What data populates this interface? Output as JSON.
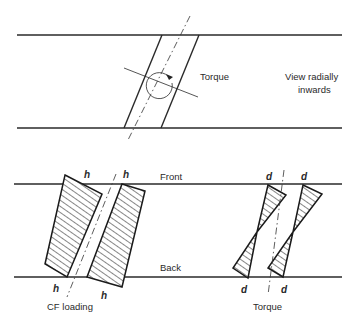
{
  "top_view": {
    "torque_label": "Torque",
    "view_label_line1": "View radially",
    "view_label_line2": "inwards",
    "icons": [
      "torque-rotation-arrow-icon"
    ]
  },
  "bottom_view": {
    "front_label": "Front",
    "back_label": "Back",
    "cf_section": {
      "caption": "CF loading",
      "top_labels": [
        "h",
        "h"
      ],
      "bottom_labels": [
        "h",
        "h"
      ]
    },
    "torque_section": {
      "caption": "Torque",
      "top_labels": [
        "d",
        "d"
      ],
      "bottom_labels": [
        "d",
        "d"
      ]
    }
  },
  "colors": {
    "line": "#2a2a2a",
    "background": "#ffffff"
  }
}
